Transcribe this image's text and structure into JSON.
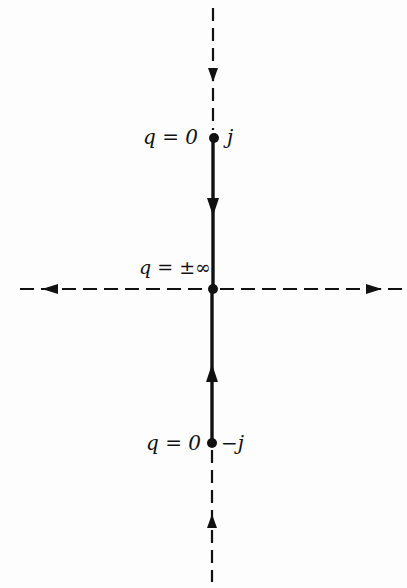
{
  "diagram": {
    "type": "root-locus",
    "colors": {
      "ink": "#111111",
      "background": "#fdfdfd"
    },
    "axes": {
      "imaginary_axis": {
        "style": "dashed",
        "direction_top": "down",
        "direction_bottom": "up"
      },
      "real_axis": {
        "style": "dashed",
        "direction_left": "left",
        "direction_right": "right"
      }
    },
    "locus": {
      "style": "solid",
      "segments": [
        {
          "from": "j",
          "to": "origin",
          "arrow": "down"
        },
        {
          "from": "-j",
          "to": "origin",
          "arrow": "up"
        }
      ]
    },
    "points": [
      {
        "name": "top-pole",
        "q_label": "q = 0",
        "value_label": "j"
      },
      {
        "name": "origin",
        "q_label": "q = ±∞"
      },
      {
        "name": "bottom-pole",
        "q_label": "q = 0",
        "value_label": "−j"
      }
    ]
  }
}
